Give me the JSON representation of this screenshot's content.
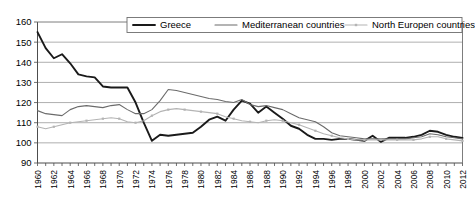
{
  "chart_data": {
    "type": "line",
    "title": "",
    "xlabel": "",
    "ylabel": "",
    "xlim": [
      1960,
      2012
    ],
    "ylim": [
      90,
      160
    ],
    "ytick_step": 10,
    "xtick_step": 2,
    "grid": true,
    "legend_position": "top",
    "yticks": [
      90,
      100,
      110,
      120,
      130,
      140,
      150,
      160
    ],
    "xticks": [
      1960,
      1962,
      1964,
      1966,
      1968,
      1970,
      1972,
      1974,
      1976,
      1978,
      1980,
      1982,
      1984,
      1986,
      1988,
      1990,
      1992,
      1994,
      1996,
      1998,
      2000,
      2002,
      2004,
      2006,
      2008,
      2010,
      2012
    ],
    "x": [
      1960,
      1961,
      1962,
      1963,
      1964,
      1965,
      1966,
      1967,
      1968,
      1969,
      1970,
      1971,
      1972,
      1973,
      1974,
      1975,
      1976,
      1977,
      1978,
      1979,
      1980,
      1981,
      1982,
      1983,
      1984,
      1985,
      1986,
      1987,
      1988,
      1989,
      1990,
      1991,
      1992,
      1993,
      1994,
      1995,
      1996,
      1997,
      1998,
      1999,
      2000,
      2001,
      2002,
      2003,
      2004,
      2005,
      2006,
      2007,
      2008,
      2009,
      2010,
      2011,
      2012
    ],
    "series": [
      {
        "name": "Greece",
        "color": "#1a1a1a",
        "values": [
          155.0,
          147.0,
          142.0,
          144.0,
          139.5,
          134.0,
          133.0,
          132.5,
          128.0,
          127.5,
          127.5,
          127.5,
          120.0,
          110.0,
          101.0,
          104.0,
          103.5,
          104.0,
          104.5,
          105.0,
          108.0,
          111.5,
          113.0,
          111.0,
          116.5,
          121.0,
          119.5,
          115.0,
          118.0,
          115.0,
          112.0,
          108.5,
          107.0,
          104.0,
          102.0,
          102.0,
          101.5,
          102.0,
          102.0,
          101.5,
          101.0,
          103.5,
          100.5,
          102.5,
          102.5,
          102.5,
          103.0,
          104.0,
          106.0,
          105.5,
          104.0,
          103.0,
          102.5
        ]
      },
      {
        "name": "Mediterranean countries",
        "color": "#6b6b6b",
        "values": [
          116.0,
          114.5,
          114.0,
          113.5,
          116.5,
          118.0,
          118.5,
          118.0,
          117.5,
          118.5,
          119.0,
          116.5,
          114.5,
          114.5,
          116.5,
          121.0,
          126.5,
          126.0,
          125.0,
          124.0,
          123.0,
          122.0,
          121.5,
          120.5,
          120.0,
          121.5,
          119.0,
          118.0,
          118.5,
          117.5,
          116.5,
          114.5,
          112.5,
          111.5,
          110.5,
          108.0,
          105.0,
          103.5,
          103.0,
          102.5,
          102.0,
          102.0,
          102.0,
          102.0,
          102.0,
          102.0,
          102.5,
          103.0,
          104.5,
          104.0,
          103.0,
          102.5,
          102.0
        ]
      },
      {
        "name": "North Europen countries",
        "color": "#b4b4b4",
        "values": [
          108.0,
          107.0,
          108.0,
          109.0,
          110.0,
          110.5,
          111.0,
          111.5,
          112.0,
          112.5,
          112.0,
          110.5,
          110.0,
          111.0,
          113.5,
          115.5,
          116.5,
          117.0,
          116.5,
          116.0,
          115.5,
          115.0,
          114.5,
          113.0,
          112.0,
          111.0,
          110.5,
          110.0,
          111.0,
          111.5,
          111.0,
          110.0,
          109.0,
          107.5,
          106.0,
          104.5,
          103.5,
          102.5,
          102.0,
          101.5,
          101.5,
          101.5,
          101.5,
          101.5,
          101.5,
          101.5,
          101.5,
          102.0,
          103.0,
          103.0,
          102.0,
          101.5,
          101.0
        ]
      }
    ]
  },
  "legend": {
    "items": [
      {
        "label": "Greece"
      },
      {
        "label": "Mediterranean countries"
      },
      {
        "label": "North Europen countries"
      }
    ]
  }
}
